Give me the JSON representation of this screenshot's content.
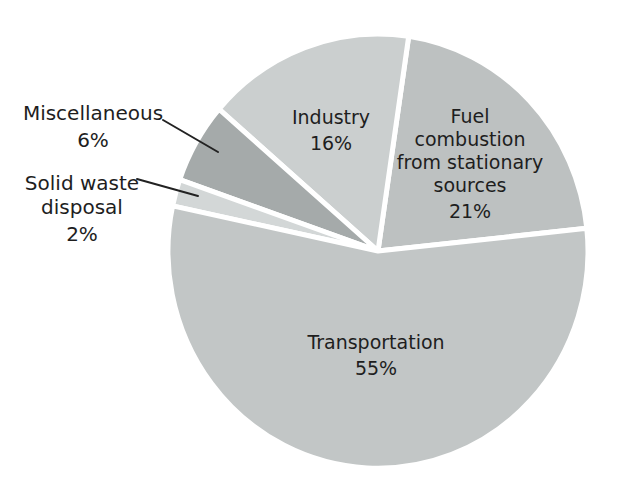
{
  "figure": {
    "background_color": "#ffffff",
    "text_color": "#1e1e1e"
  },
  "chart_data": {
    "type": "pie",
    "unit": "%",
    "total": 100,
    "start_angle_deg": 6,
    "direction": "ccw",
    "gap_color": "#ffffff",
    "gap_width_px": 5,
    "geometry": {
      "cx": 378,
      "cy": 251,
      "rx": 210,
      "ry": 217
    },
    "slices": [
      {
        "slug": "fuel-combustion-from-stationary-sources",
        "label": "Fuel combustion from stationary sources",
        "label_lines": [
          "Fuel",
          "combustion",
          "from stationary",
          "sources"
        ],
        "value": 21,
        "pct_label": "21%",
        "color": "#bdc1c1",
        "label_placement": "inside"
      },
      {
        "slug": "industry",
        "label": "Industry",
        "label_lines": [
          "Industry"
        ],
        "value": 16,
        "pct_label": "16%",
        "color": "#cbcfcf",
        "label_placement": "inside"
      },
      {
        "slug": "miscellaneous",
        "label": "Miscellaneous",
        "label_lines": [
          "Miscellaneous"
        ],
        "value": 6,
        "pct_label": "6%",
        "color": "#a5aaaa",
        "label_placement": "outside-left"
      },
      {
        "slug": "solid-waste-disposal",
        "label": "Solid waste disposal",
        "label_lines": [
          "Solid waste",
          "disposal"
        ],
        "value": 2,
        "pct_label": "2%",
        "color": "#d3d7d7",
        "label_placement": "outside-left"
      },
      {
        "slug": "transportation",
        "label": "Transportation",
        "label_lines": [
          "Transportation"
        ],
        "value": 55,
        "pct_label": "55%",
        "color": "#c2c6c6",
        "label_placement": "inside"
      }
    ],
    "leader_lines": [
      {
        "for": "miscellaneous",
        "x1": 163,
        "y1": 120,
        "x2": 218,
        "y2": 152
      },
      {
        "for": "solid-waste-disposal",
        "x1": 137,
        "y1": 179,
        "x2": 198,
        "y2": 196
      }
    ]
  }
}
